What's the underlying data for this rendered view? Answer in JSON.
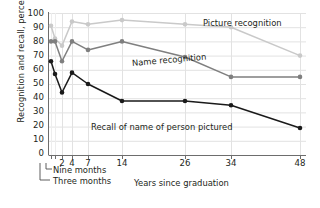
{
  "chart_data": {
    "type": "line",
    "title": "",
    "xlabel": "Years since graduation",
    "ylabel": "Recognition and recall, percent",
    "ylim": [
      0,
      100
    ],
    "ytick_labels": [
      "100",
      "90",
      "80",
      "70",
      "60",
      "50",
      "40",
      "30",
      "20",
      "10",
      "0"
    ],
    "ytick_values": [
      100,
      90,
      80,
      70,
      60,
      50,
      40,
      30,
      20,
      10,
      0
    ],
    "xtick_labels": [
      "2",
      "4",
      "7",
      "14",
      "26",
      "34",
      "48"
    ],
    "x_categories": [
      "Three months",
      "Nine months",
      "2",
      "4",
      "7",
      "14",
      "26",
      "34",
      "48"
    ],
    "grid": true,
    "legend": "inline-labels",
    "annotations": [
      {
        "name": "nine-months-annotation",
        "text": "Nine months"
      },
      {
        "name": "three-months-annotation",
        "text": "Three months"
      }
    ],
    "series": [
      {
        "name": "Picture recognition",
        "color": "#c9c9c9",
        "values": [
          91,
          82,
          77,
          94,
          92,
          95,
          92,
          90,
          70
        ]
      },
      {
        "name": "Name recognition",
        "color": "#7f7f7f",
        "values": [
          80,
          80,
          66,
          80,
          74,
          80,
          69,
          55,
          55
        ]
      },
      {
        "name": "Recall of name of person pictured",
        "color": "#1a1a1a",
        "values": [
          66,
          57,
          44,
          58,
          50,
          38,
          38,
          35,
          19
        ]
      }
    ]
  },
  "axis": {
    "y_title": "Recognition and recall, percent",
    "x_title": "Years since graduation"
  },
  "labels": {
    "picture_recognition": "Picture recognition",
    "name_recognition": "Name recognition",
    "recall_of_name": "Recall of name of person pictured",
    "nine_months": "Nine months",
    "three_months": "Three months"
  }
}
